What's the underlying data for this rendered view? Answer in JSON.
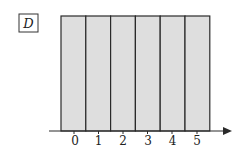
{
  "figure": {
    "label": "D",
    "colors": {
      "fill": "#dedede",
      "stroke": "#2a2a2a",
      "background": "#ffffff"
    },
    "bars": {
      "count": 6,
      "x_positions": [
        0,
        1,
        2,
        3,
        4,
        5
      ]
    },
    "axis": {
      "tick_labels": [
        "0",
        "1",
        "2",
        "3",
        "4",
        "5"
      ],
      "arrow": true
    }
  }
}
